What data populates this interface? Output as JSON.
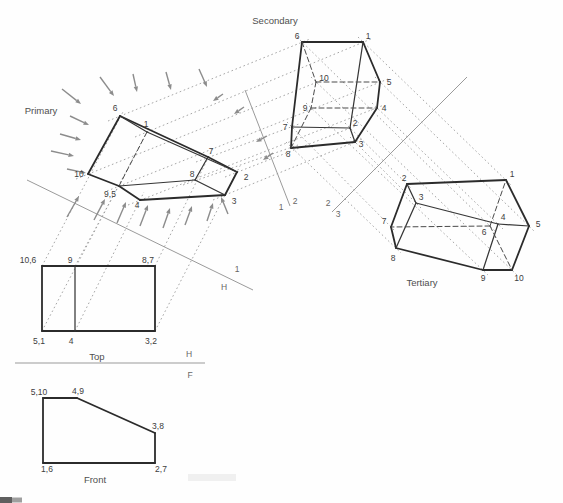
{
  "drawing_title": "Successive auxiliary views of a truncated prism",
  "colors": {
    "background": "#fefefe",
    "outline": "#2b2b2b",
    "inner_edge": "#363636",
    "hidden_edge": "#4a4a4a",
    "projection_line": "#9c9c9c",
    "fold_line": "#9a9a9a",
    "arrow": "#8c8c8c",
    "point_label": "#3d3d3d",
    "view_label": "#4f4f4f",
    "fold_label": "#666666"
  },
  "views": {
    "primary": {
      "title": "Primary",
      "title_pos": [
        41,
        114
      ],
      "vertices": {
        "6": [
          120,
          116
        ],
        "1": [
          147,
          132
        ],
        "7": [
          208,
          157
        ],
        "2": [
          237,
          172
        ],
        "8": [
          195,
          180
        ],
        "10": [
          88,
          174
        ],
        "9,5": [
          119,
          186
        ],
        "4": [
          140,
          200
        ],
        "3": [
          225,
          195
        ]
      },
      "labels": [
        {
          "text": "6",
          "x": 115,
          "y": 111
        },
        {
          "text": "1",
          "x": 146,
          "y": 127
        },
        {
          "text": "7",
          "x": 211,
          "y": 154
        },
        {
          "text": "2",
          "x": 246,
          "y": 180
        },
        {
          "text": "8",
          "x": 192,
          "y": 177
        },
        {
          "text": "10",
          "x": 79,
          "y": 177
        },
        {
          "text": "9,5",
          "x": 110,
          "y": 197
        },
        {
          "text": "4",
          "x": 137,
          "y": 208
        },
        {
          "text": "3",
          "x": 234,
          "y": 204
        }
      ],
      "edges": [
        {
          "from": "10",
          "to": "6",
          "style": "outline"
        },
        {
          "from": "6",
          "to": "7",
          "style": "outline"
        },
        {
          "from": "7",
          "to": "2",
          "style": "outline"
        },
        {
          "from": "2",
          "to": "3",
          "style": "outline"
        },
        {
          "from": "3",
          "to": "4",
          "style": "outline"
        },
        {
          "from": "4",
          "to": "9,5",
          "style": "outline"
        },
        {
          "from": "9,5",
          "to": "10",
          "style": "outline"
        },
        {
          "from": "1",
          "to": "6",
          "style": "inner"
        },
        {
          "from": "1",
          "to": "2",
          "style": "inner"
        },
        {
          "from": "7",
          "to": "8",
          "style": "inner"
        },
        {
          "from": "8",
          "to": "9,5",
          "style": "inner"
        },
        {
          "from": "8",
          "to": "3",
          "style": "inner"
        },
        {
          "from": "1",
          "to": "9,5",
          "style": "hidden"
        }
      ]
    },
    "secondary": {
      "title": "Secondary",
      "title_pos": [
        275,
        24
      ],
      "vertices": {
        "6": [
          302,
          42
        ],
        "1": [
          363,
          42
        ],
        "10": [
          316,
          82
        ],
        "5": [
          380,
          82
        ],
        "9": [
          311,
          108
        ],
        "4": [
          377,
          108
        ],
        "7": [
          292,
          127
        ],
        "2": [
          350,
          128
        ],
        "3": [
          355,
          142
        ],
        "8": [
          291,
          148
        ]
      },
      "labels": [
        {
          "text": "6",
          "x": 297,
          "y": 39
        },
        {
          "text": "1",
          "x": 368,
          "y": 39
        },
        {
          "text": "10",
          "x": 324,
          "y": 81
        },
        {
          "text": "5",
          "x": 389,
          "y": 85
        },
        {
          "text": "9",
          "x": 305,
          "y": 111
        },
        {
          "text": "4",
          "x": 384,
          "y": 111
        },
        {
          "text": "7",
          "x": 285,
          "y": 130
        },
        {
          "text": "2",
          "x": 355,
          "y": 126
        },
        {
          "text": "3",
          "x": 361,
          "y": 147
        },
        {
          "text": "8",
          "x": 288,
          "y": 157
        }
      ],
      "edges": [
        {
          "from": "6",
          "to": "1",
          "style": "outline"
        },
        {
          "from": "1",
          "to": "5",
          "style": "outline"
        },
        {
          "from": "5",
          "to": "4",
          "style": "outline"
        },
        {
          "from": "4",
          "to": "3",
          "style": "outline"
        },
        {
          "from": "3",
          "to": "8",
          "style": "outline"
        },
        {
          "from": "8",
          "to": "7",
          "style": "outline"
        },
        {
          "from": "7",
          "to": "6",
          "style": "outline"
        },
        {
          "from": "1",
          "to": "2",
          "style": "inner"
        },
        {
          "from": "7",
          "to": "2",
          "style": "inner"
        },
        {
          "from": "2",
          "to": "3",
          "style": "inner"
        },
        {
          "from": "6",
          "to": "10",
          "style": "hidden"
        },
        {
          "from": "10",
          "to": "5",
          "style": "hidden"
        },
        {
          "from": "10",
          "to": "9",
          "style": "hidden"
        },
        {
          "from": "9",
          "to": "4",
          "style": "hidden"
        },
        {
          "from": "9",
          "to": "8",
          "style": "hidden"
        }
      ]
    },
    "tertiary": {
      "title": "Tertiary",
      "title_pos": [
        422,
        286
      ],
      "vertices": {
        "1": [
          506,
          180
        ],
        "2": [
          407,
          184
        ],
        "3": [
          416,
          203
        ],
        "7": [
          391,
          227
        ],
        "4": [
          498,
          224
        ],
        "5": [
          529,
          226
        ],
        "6": [
          490,
          226
        ],
        "8": [
          396,
          248
        ],
        "9": [
          483,
          270
        ],
        "10": [
          512,
          270
        ]
      },
      "labels": [
        {
          "text": "1",
          "x": 512,
          "y": 177
        },
        {
          "text": "2",
          "x": 404,
          "y": 181
        },
        {
          "text": "3",
          "x": 421,
          "y": 200
        },
        {
          "text": "7",
          "x": 384,
          "y": 224
        },
        {
          "text": "4",
          "x": 503,
          "y": 220
        },
        {
          "text": "5",
          "x": 538,
          "y": 227
        },
        {
          "text": "6",
          "x": 484,
          "y": 235
        },
        {
          "text": "8",
          "x": 393,
          "y": 261
        },
        {
          "text": "9",
          "x": 483,
          "y": 281
        },
        {
          "text": "10",
          "x": 519,
          "y": 281
        }
      ],
      "edges": [
        {
          "from": "2",
          "to": "1",
          "style": "outline"
        },
        {
          "from": "1",
          "to": "5",
          "style": "outline"
        },
        {
          "from": "5",
          "to": "10",
          "style": "outline"
        },
        {
          "from": "10",
          "to": "9",
          "style": "outline"
        },
        {
          "from": "9",
          "to": "8",
          "style": "outline"
        },
        {
          "from": "8",
          "to": "7",
          "style": "outline"
        },
        {
          "from": "7",
          "to": "2",
          "style": "outline"
        },
        {
          "from": "2",
          "to": "3",
          "style": "inner"
        },
        {
          "from": "3",
          "to": "4",
          "style": "inner"
        },
        {
          "from": "4",
          "to": "5",
          "style": "inner"
        },
        {
          "from": "3",
          "to": "8",
          "style": "inner"
        },
        {
          "from": "4",
          "to": "9",
          "style": "inner"
        },
        {
          "from": "6",
          "to": "1",
          "style": "hidden"
        },
        {
          "from": "6",
          "to": "7",
          "style": "hidden"
        },
        {
          "from": "6",
          "to": "10",
          "style": "hidden"
        }
      ]
    },
    "top": {
      "title": "Top",
      "title_pos": [
        97,
        360
      ],
      "vertices": {
        "10,6": [
          42,
          266
        ],
        "9": [
          75,
          266
        ],
        "8,7": [
          155,
          266
        ],
        "5,1": [
          42,
          331
        ],
        "4": [
          75,
          331
        ],
        "3,2": [
          155,
          331
        ]
      },
      "labels": [
        {
          "text": "10,6",
          "x": 28,
          "y": 263
        },
        {
          "text": "9",
          "x": 70,
          "y": 263
        },
        {
          "text": "8,7",
          "x": 148,
          "y": 263
        },
        {
          "text": "5,1",
          "x": 39,
          "y": 344
        },
        {
          "text": "4",
          "x": 71,
          "y": 344
        },
        {
          "text": "3,2",
          "x": 151,
          "y": 344
        }
      ],
      "edges": [
        {
          "from": "10,6",
          "to": "8,7",
          "style": "outline"
        },
        {
          "from": "8,7",
          "to": "3,2",
          "style": "outline"
        },
        {
          "from": "3,2",
          "to": "5,1",
          "style": "outline"
        },
        {
          "from": "5,1",
          "to": "10,6",
          "style": "outline"
        },
        {
          "from": "9",
          "to": "4",
          "style": "inner"
        }
      ]
    },
    "front": {
      "title": "Front",
      "title_pos": [
        95,
        483
      ],
      "vertices": {
        "5,10": [
          43,
          398
        ],
        "4,9": [
          77,
          398
        ],
        "3,8": [
          155,
          433
        ],
        "2,7": [
          155,
          463
        ],
        "1,6": [
          43,
          463
        ]
      },
      "labels": [
        {
          "text": "5,10",
          "x": 39,
          "y": 395
        },
        {
          "text": "4,9",
          "x": 78,
          "y": 394
        },
        {
          "text": "3,8",
          "x": 158,
          "y": 429
        },
        {
          "text": "2,7",
          "x": 161,
          "y": 472
        },
        {
          "text": "1,6",
          "x": 47,
          "y": 472
        }
      ],
      "edges": [
        {
          "from": "5,10",
          "to": "4,9",
          "style": "outline"
        },
        {
          "from": "4,9",
          "to": "3,8",
          "style": "outline"
        },
        {
          "from": "3,8",
          "to": "2,7",
          "style": "outline"
        },
        {
          "from": "2,7",
          "to": "1,6",
          "style": "outline"
        },
        {
          "from": "1,6",
          "to": "5,10",
          "style": "outline"
        }
      ]
    }
  },
  "fold_lines": [
    {
      "name": "H-1",
      "from": [
        27,
        180
      ],
      "to": [
        253,
        290
      ],
      "labels": [
        {
          "text": "1",
          "x": 237,
          "y": 272
        },
        {
          "text": "H",
          "x": 224,
          "y": 290
        }
      ]
    },
    {
      "name": "H-F",
      "from": [
        15,
        363
      ],
      "to": [
        205,
        363
      ],
      "labels": [
        {
          "text": "H",
          "x": 189,
          "y": 357
        },
        {
          "text": "F",
          "x": 190,
          "y": 378
        }
      ]
    },
    {
      "name": "1-2",
      "from": [
        245,
        90
      ],
      "to": [
        290,
        206
      ],
      "labels": [
        {
          "text": "1",
          "x": 281,
          "y": 210
        },
        {
          "text": "2",
          "x": 295,
          "y": 204
        }
      ]
    },
    {
      "name": "2-3",
      "from": [
        332,
        212
      ],
      "to": [
        467,
        77
      ],
      "labels": [
        {
          "text": "2",
          "x": 328,
          "y": 206
        },
        {
          "text": "3",
          "x": 338,
          "y": 217
        }
      ]
    }
  ],
  "projection_lines": {
    "top_to_primary": [
      [
        [
          42,
          266
        ],
        [
          124,
          110
        ]
      ],
      [
        [
          75,
          266
        ],
        [
          123,
          178
        ]
      ],
      [
        [
          155,
          266
        ],
        [
          212,
          150
        ]
      ],
      [
        [
          42,
          331
        ],
        [
          150,
          126
        ]
      ],
      [
        [
          75,
          331
        ],
        [
          144,
          192
        ]
      ],
      [
        [
          155,
          331
        ],
        [
          240,
          166
        ]
      ]
    ],
    "primary_to_secondary": [
      [
        [
          108,
          121
        ],
        [
          310,
          39
        ]
      ],
      [
        [
          135,
          137
        ],
        [
          371,
          39
        ]
      ],
      [
        [
          76,
          179
        ],
        [
          325,
          79
        ]
      ],
      [
        [
          107,
          191
        ],
        [
          388,
          79
        ]
      ],
      [
        [
          128,
          205
        ],
        [
          384,
          105
        ]
      ],
      [
        [
          196,
          162
        ],
        [
          299,
          124
        ]
      ],
      [
        [
          183,
          185
        ],
        [
          298,
          145
        ]
      ],
      [
        [
          225,
          177
        ],
        [
          358,
          125
        ]
      ],
      [
        [
          213,
          200
        ],
        [
          362,
          139
        ]
      ]
    ],
    "secondary_to_tertiary": [
      [
        [
          358,
          37
        ],
        [
          511,
          185
        ]
      ],
      [
        [
          345,
          123
        ],
        [
          412,
          189
        ]
      ],
      [
        [
          350,
          137
        ],
        [
          421,
          208
        ]
      ],
      [
        [
          372,
          103
        ],
        [
          503,
          229
        ]
      ],
      [
        [
          375,
          77
        ],
        [
          534,
          231
        ]
      ],
      [
        [
          297,
          37
        ],
        [
          495,
          231
        ]
      ],
      [
        [
          287,
          122
        ],
        [
          396,
          232
        ]
      ],
      [
        [
          286,
          142
        ],
        [
          401,
          253
        ]
      ],
      [
        [
          306,
          103
        ],
        [
          488,
          275
        ]
      ],
      [
        [
          311,
          77
        ],
        [
          517,
          275
        ]
      ]
    ]
  },
  "view_direction_arrows": [
    {
      "from": [
        100,
        77
      ],
      "to": [
        114,
        96
      ]
    },
    {
      "from": [
        133,
        74
      ],
      "to": [
        137,
        92
      ]
    },
    {
      "from": [
        166,
        72
      ],
      "to": [
        171,
        90
      ]
    },
    {
      "from": [
        199,
        69
      ],
      "to": [
        207,
        87
      ]
    },
    {
      "from": [
        62,
        89
      ],
      "to": [
        81,
        104
      ]
    },
    {
      "from": [
        70,
        116
      ],
      "to": [
        89,
        125
      ]
    },
    {
      "from": [
        60,
        134
      ],
      "to": [
        81,
        140
      ]
    },
    {
      "from": [
        51,
        151
      ],
      "to": [
        74,
        156
      ]
    },
    {
      "from": [
        67,
        169
      ],
      "to": [
        86,
        173
      ]
    },
    {
      "from": [
        67,
        217
      ],
      "to": [
        79,
        196
      ]
    },
    {
      "from": [
        94,
        220
      ],
      "to": [
        105,
        199
      ]
    },
    {
      "from": [
        117,
        223
      ],
      "to": [
        126,
        202
      ]
    },
    {
      "from": [
        140,
        226
      ],
      "to": [
        148,
        205
      ]
    },
    {
      "from": [
        163,
        228
      ],
      "to": [
        170,
        208
      ]
    },
    {
      "from": [
        185,
        225
      ],
      "to": [
        192,
        206
      ]
    },
    {
      "from": [
        207,
        221
      ],
      "to": [
        213,
        203
      ]
    },
    {
      "from": [
        228,
        214
      ],
      "to": [
        221,
        197
      ]
    },
    {
      "from": [
        223,
        94
      ],
      "to": [
        213,
        101
      ]
    },
    {
      "from": [
        244,
        107
      ],
      "to": [
        234,
        114
      ]
    },
    {
      "from": [
        267,
        136
      ],
      "to": [
        256,
        142
      ]
    },
    {
      "from": [
        273,
        153
      ],
      "to": [
        263,
        160
      ]
    }
  ],
  "scan_artifacts": [
    {
      "x": 0,
      "y": 497,
      "w": 12,
      "h": 6,
      "color": "#5f5f5f"
    },
    {
      "x": 12,
      "y": 497.5,
      "w": 10,
      "h": 5,
      "color": "#9f9f9f"
    },
    {
      "x": 188,
      "y": 474,
      "w": 48,
      "h": 7,
      "color": "#f0f0f0"
    }
  ]
}
